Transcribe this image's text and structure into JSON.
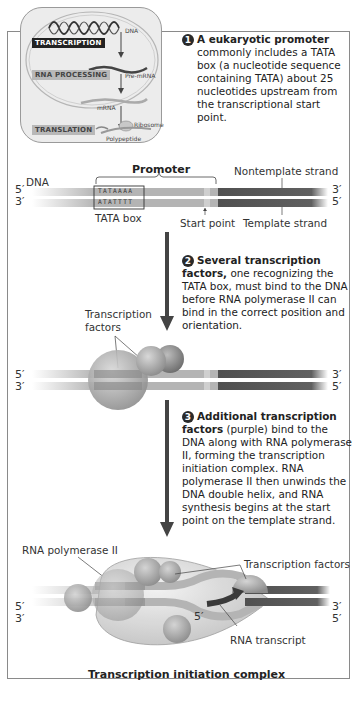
{
  "inset": {
    "dna_label": "DNA",
    "transcription": "TRANSCRIPTION",
    "rna_processing": "RNA PROCESSING",
    "pre_mrna": "Pre-mRNA",
    "mrna": "mRNA",
    "translation": "TRANSLATION",
    "ribosome": "Ribosome",
    "polypeptide": "Polypeptide"
  },
  "steps": [
    {
      "number": "1",
      "bold": "A eukaryotic promoter",
      "text": "commonly includes a TATA box (a nucleotide sequence containing TATA) about 25 nucleotides upstream from the transcriptional start point."
    },
    {
      "number": "2",
      "bold": "Several transcription factors,",
      "text": "one recognizing the TATA box, must bind to the DNA before RNA polymerase II can bind in the correct position and orientation."
    },
    {
      "number": "3",
      "bold": "Additional transcription factors",
      "text": "(purple) bind to the DNA along with RNA polymerase II, forming the transcription initiation complex. RNA polymerase II then unwinds the DNA double helix, and RNA synthesis begins at the start point on the template strand."
    }
  ],
  "panel1": {
    "dna_label": "DNA",
    "promoter_label": "Promoter",
    "nontemplate_label": "Nontemplate strand",
    "template_label": "Template strand",
    "start_point_label": "Start point",
    "tata_box_label": "TATA box",
    "top_seq": "TATAAAA",
    "bottom_seq": "ATATTTT",
    "top_left_end": "5′",
    "top_right_end": "3′",
    "bottom_left_end": "3′",
    "bottom_right_end": "5′"
  },
  "panel2": {
    "tf_label_line1": "Transcription",
    "tf_label_line2": "factors",
    "top_left_end": "5′",
    "top_right_end": "3′",
    "bottom_left_end": "3′",
    "bottom_right_end": "5′"
  },
  "panel3": {
    "pol_label": "RNA polymerase II",
    "tf_label": "Transcription factors",
    "rna_transcript_label": "RNA transcript",
    "rna_5prime": "5′",
    "complex_label": "Transcription initiation complex",
    "top_left_end": "5′",
    "top_right_end": "3′",
    "bottom_left_end": "3′",
    "bottom_right_end": "5′"
  },
  "colors": {
    "light_strand": "#b4b4b4",
    "dark_strand": "#505050",
    "arrow": "#444444",
    "protein": "#a0a0a0"
  }
}
